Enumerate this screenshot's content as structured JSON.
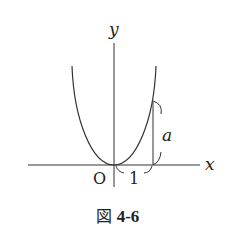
{
  "diagram": {
    "type": "function-graph",
    "axes": {
      "x_label": "x",
      "y_label": "y",
      "origin_label": "O"
    },
    "annotations": {
      "horizontal_span_label": "1",
      "vertical_span_label": "a"
    },
    "colors": {
      "stroke": "#333333",
      "background": "#ffffff"
    }
  },
  "caption": {
    "prefix": "図",
    "number": "4-6"
  }
}
